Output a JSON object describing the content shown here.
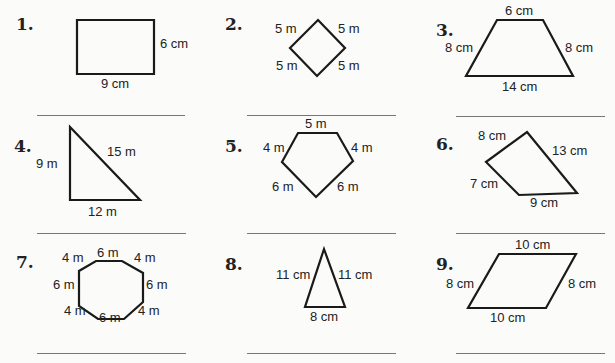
{
  "problems": [
    {
      "number": "1.",
      "shape": "rectangle",
      "labels": [
        "6 cm",
        "9 cm"
      ]
    },
    {
      "number": "2.",
      "shape": "square (rhombus)",
      "labels": [
        "5 m",
        "5 m",
        "5 m",
        "5 m"
      ]
    },
    {
      "number": "3.",
      "shape": "trapezoid",
      "labels": [
        "6 cm",
        "8 cm",
        "8 cm",
        "14 cm"
      ]
    },
    {
      "number": "4.",
      "shape": "right triangle",
      "labels": [
        "9 m",
        "15 m",
        "12 m"
      ]
    },
    {
      "number": "5.",
      "shape": "pentagon",
      "labels": [
        "5 m",
        "4 m",
        "4 m",
        "6 m",
        "6 m"
      ]
    },
    {
      "number": "6.",
      "shape": "quadrilateral",
      "labels": [
        "8 cm",
        "13 cm",
        "7 cm",
        "9 cm"
      ]
    },
    {
      "number": "7.",
      "shape": "octagon",
      "labels": [
        "4 m",
        "6 m",
        "4 m",
        "6 m",
        "6 m",
        "4 m",
        "6 m",
        "4 m"
      ]
    },
    {
      "number": "8.",
      "shape": "isosceles triangle",
      "labels": [
        "11 cm",
        "11 cm",
        "8 cm"
      ]
    },
    {
      "number": "9.",
      "shape": "parallelogram",
      "labels": [
        "10 cm",
        "8 cm",
        "8 cm",
        "10 cm"
      ]
    }
  ]
}
